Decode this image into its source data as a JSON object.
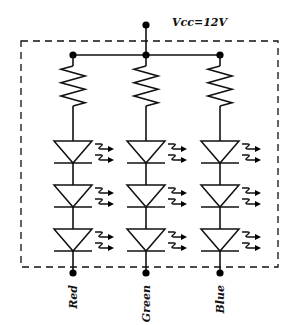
{
  "diagram": {
    "supply_label": "Vcc=12V",
    "channels": [
      {
        "name": "Red",
        "resistors": 1,
        "leds": 3
      },
      {
        "name": "Green",
        "resistors": 1,
        "leds": 3
      },
      {
        "name": "Blue",
        "resistors": 1,
        "leds": 3
      }
    ],
    "leds_per_channel": 3,
    "enclosure": "dashed"
  }
}
